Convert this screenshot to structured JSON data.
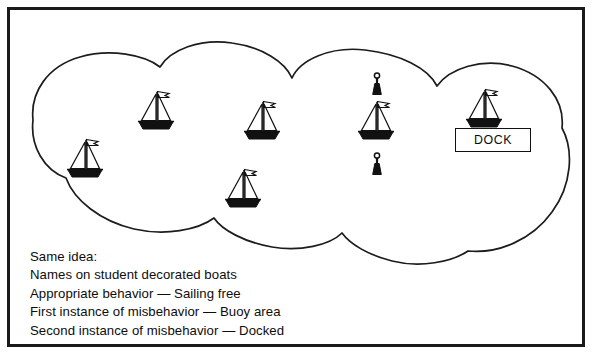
{
  "page": {
    "background_color": "#ffffff",
    "ink_color": "#111111"
  },
  "frame": {
    "border_color": "#1a1a1a"
  },
  "dock": {
    "label": "DOCK",
    "border_color": "#111111"
  },
  "legend": {
    "lines": [
      "Same idea:",
      "Names on student decorated boats",
      "Appropriate behavior — Sailing free",
      "First instance of misbehavior — Buoy area",
      "Second instance of misbehavior — Docked"
    ]
  },
  "scene": {
    "cloud_name": "water-area-cloud-outline",
    "boats": [
      {
        "name": "boat-1",
        "x": 85,
        "y": 160,
        "scale": 1.0,
        "flag": "right"
      },
      {
        "name": "boat-2",
        "x": 156,
        "y": 112,
        "scale": 1.0,
        "flag": "right"
      },
      {
        "name": "boat-3",
        "x": 262,
        "y": 122,
        "scale": 1.0,
        "flag": "right"
      },
      {
        "name": "boat-4",
        "x": 243,
        "y": 190,
        "scale": 1.0,
        "flag": "right"
      },
      {
        "name": "boat-5",
        "x": 376,
        "y": 122,
        "scale": 1.0,
        "flag": "right"
      },
      {
        "name": "boat-6",
        "x": 484,
        "y": 110,
        "scale": 1.0,
        "flag": "right"
      }
    ],
    "buoys": [
      {
        "name": "buoy-1",
        "x": 377,
        "y": 85
      },
      {
        "name": "buoy-2",
        "x": 377,
        "y": 165
      }
    ]
  }
}
